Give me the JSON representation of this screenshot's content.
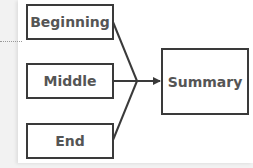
{
  "diagram": {
    "type": "convergent-flow",
    "inputs": [
      {
        "id": "beginning",
        "label": "Beginning"
      },
      {
        "id": "middle",
        "label": "Middle"
      },
      {
        "id": "end",
        "label": "End"
      }
    ],
    "output": {
      "id": "summary",
      "label": "Summary"
    },
    "edges": [
      {
        "from": "beginning",
        "to": "summary"
      },
      {
        "from": "middle",
        "to": "summary"
      },
      {
        "from": "end",
        "to": "summary"
      }
    ],
    "colors": {
      "border": "#3a3a3a",
      "text": "#555555",
      "background": "#ffffff"
    }
  }
}
